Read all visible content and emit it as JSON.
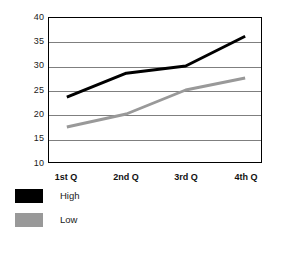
{
  "chart_data": {
    "type": "line",
    "title": "",
    "subtitle": "",
    "xlabel": "",
    "ylabel": "",
    "categories": [
      "1st Q",
      "2nd Q",
      "3rd Q",
      "4th Q"
    ],
    "ylim": [
      10,
      40
    ],
    "yticks": [
      10,
      15,
      20,
      25,
      30,
      35,
      40
    ],
    "ytick_labels": [
      "10",
      "15",
      "20",
      "25",
      "30",
      "35",
      "40"
    ],
    "grid": true,
    "legend_position": "below",
    "series": [
      {
        "name": "High",
        "color": "#000000",
        "values": [
          23.5,
          28.5,
          30.0,
          36.2
        ]
      },
      {
        "name": "Low",
        "color": "#999999",
        "values": [
          17.3,
          20.0,
          25.0,
          27.5
        ]
      }
    ]
  },
  "legend": {
    "items": [
      {
        "label": "High",
        "color": "#000000"
      },
      {
        "label": "Low",
        "color": "#999999"
      }
    ]
  },
  "axes": {
    "border_color": "#000000",
    "grid_color": "#7f7f7f"
  }
}
